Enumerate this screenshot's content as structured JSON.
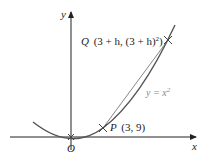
{
  "diagram": {
    "axes": {
      "x_label": "x",
      "y_label": "y",
      "origin_label": "O"
    },
    "curve": {
      "equation_label_prefix": "y = x",
      "equation_label_exp": "2",
      "color": "#555555"
    },
    "points": {
      "P": {
        "name": "P",
        "coords": "(3, 9)"
      },
      "Q": {
        "name": "Q",
        "coords_prefix": "(3 + h, (3 + h)",
        "coords_exp": "2",
        "coords_suffix": ")"
      }
    },
    "chord_color": "#666666"
  }
}
